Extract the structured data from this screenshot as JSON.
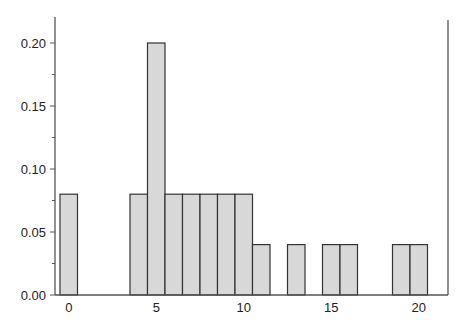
{
  "chart_data": {
    "type": "bar",
    "subtype": "histogram",
    "title": "",
    "xlabel": "",
    "ylabel": "",
    "categories": [
      0,
      4,
      5,
      6,
      7,
      8,
      9,
      10,
      11,
      13,
      15,
      16,
      19,
      20
    ],
    "values": [
      0.08,
      0.08,
      0.2,
      0.08,
      0.08,
      0.08,
      0.08,
      0.08,
      0.04,
      0.04,
      0.04,
      0.04,
      0.04,
      0.04
    ],
    "bin_width": 1,
    "xlim": [
      -0.4,
      21.4
    ],
    "ylim": [
      0,
      0.22
    ],
    "xticks": [
      0,
      5,
      10,
      15,
      20
    ],
    "xtick_labels": [
      "0",
      "5",
      "10",
      "15",
      "20"
    ],
    "yticks": [
      0.0,
      0.05,
      0.1,
      0.15,
      0.2
    ],
    "ytick_labels": [
      "0.00",
      "0.05",
      "0.10",
      "0.15",
      "0.20"
    ],
    "yminor_step": 0.025,
    "grid": false,
    "legend": null,
    "colors": {
      "bar_fill": "#d8d8d8",
      "bar_edge": "#333333",
      "axis": "#555555"
    }
  }
}
